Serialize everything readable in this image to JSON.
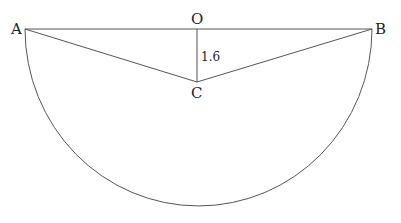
{
  "diagram": {
    "type": "geometry",
    "points": {
      "A": {
        "label": "A",
        "x": 25,
        "y": 29
      },
      "B": {
        "label": "B",
        "x": 372,
        "y": 29
      },
      "O": {
        "label": "O",
        "x": 197,
        "y": 29
      },
      "C": {
        "label": "C",
        "x": 197,
        "y": 82
      }
    },
    "segments": [
      "AB",
      "AC",
      "BC",
      "OC"
    ],
    "arc": {
      "from": "A",
      "to": "B",
      "bottom_y": 206
    },
    "measurements": {
      "OC": "1.6"
    },
    "line_color": "#555555"
  }
}
